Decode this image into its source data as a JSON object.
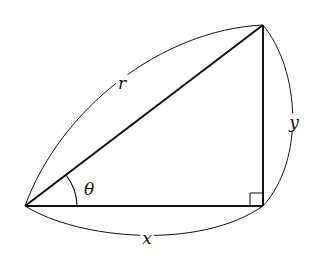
{
  "diagram": {
    "type": "right-triangle",
    "vertices": {
      "origin": [
        25,
        206
      ],
      "right_angle": [
        263,
        206
      ],
      "top": [
        263,
        25
      ]
    },
    "labels": {
      "hypotenuse": "r",
      "vertical_leg": "y",
      "horizontal_leg": "x",
      "angle": "θ"
    },
    "right_angle_marker": true,
    "angle_arc": true,
    "colors": {
      "stroke": "#111111",
      "background": "#ffffff"
    }
  }
}
